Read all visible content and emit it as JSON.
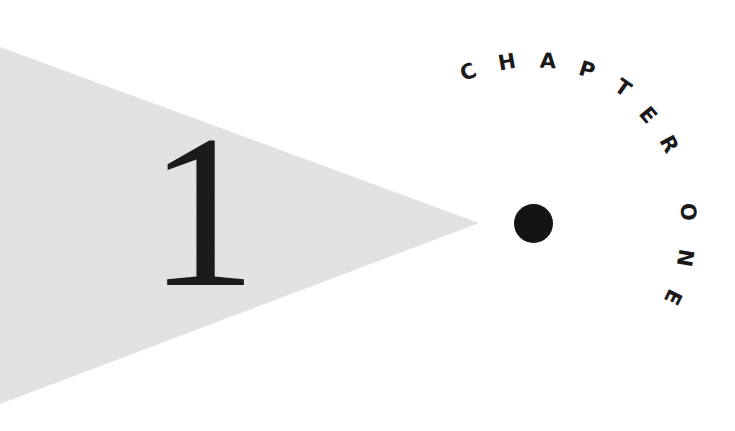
{
  "chapter": {
    "number": "1",
    "heading_letters": [
      {
        "char": "C",
        "x": 468,
        "y": 72,
        "rot": -23
      },
      {
        "char": "H",
        "x": 507,
        "y": 62,
        "rot": -10
      },
      {
        "char": "A",
        "x": 548,
        "y": 61,
        "rot": 3
      },
      {
        "char": "P",
        "x": 587,
        "y": 70,
        "rot": 18
      },
      {
        "char": "T",
        "x": 623,
        "y": 88,
        "rot": 35
      },
      {
        "char": "E",
        "x": 648,
        "y": 115,
        "rot": 50
      },
      {
        "char": "R",
        "x": 669,
        "y": 144,
        "rot": 62
      },
      {
        "char": "O",
        "x": 688,
        "y": 212,
        "rot": 86
      },
      {
        "char": "N",
        "x": 685,
        "y": 258,
        "rot": 100
      },
      {
        "char": "E",
        "x": 673,
        "y": 297,
        "rot": 116
      }
    ],
    "heading_text": "CHAPTER ONE"
  },
  "colors": {
    "pennant": "#e3e3e3",
    "ink": "#1a1a1a",
    "background": "#ffffff"
  }
}
